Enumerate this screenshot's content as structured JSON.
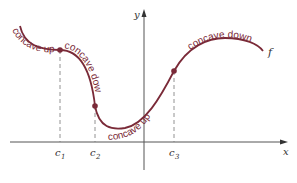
{
  "figure": {
    "function_label": "f",
    "x_axis_label": "x",
    "y_axis_label": "y",
    "colors": {
      "curve": "#7a2a38",
      "axes": "#555555",
      "dashes": "#777777",
      "text": "#333333"
    },
    "regions": [
      {
        "label": "concave up"
      },
      {
        "label": "concave down"
      },
      {
        "label": "concave up"
      },
      {
        "label": "concave down"
      }
    ],
    "inflection_points": [
      {
        "label": "c",
        "sub": "1"
      },
      {
        "label": "c",
        "sub": "2"
      },
      {
        "label": "c",
        "sub": "3"
      }
    ]
  }
}
